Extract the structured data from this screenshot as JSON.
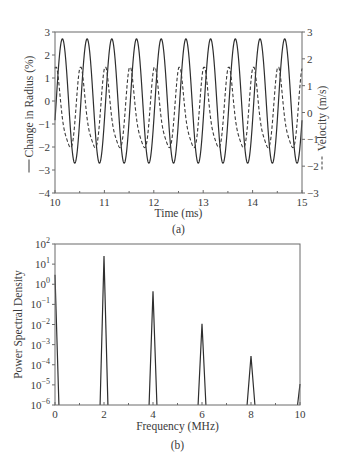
{
  "chart_data": [
    {
      "panel": "(a)",
      "type": "line",
      "xlabel": "Time (ms)",
      "ylabel_left": "Change in Radius (%)",
      "ylabel_right": "Velocity (m/s)",
      "xlim": [
        10,
        15
      ],
      "ylim_left": [
        -4,
        3
      ],
      "ylim_right": [
        -3,
        3
      ],
      "x_ticks": [
        10,
        11,
        12,
        13,
        14,
        15
      ],
      "y_ticks_left": [
        3,
        2,
        1,
        0,
        -1,
        -2,
        -3,
        -4
      ],
      "y_ticks_right": [
        3,
        2,
        1,
        0,
        -1,
        -2,
        -3
      ],
      "grid": false,
      "series": [
        {
          "name": "Change in Radius (%)",
          "axis": "left",
          "style": "solid",
          "model": "sinusoid",
          "amplitude": 2.7,
          "offset": 0.0,
          "period_ms": 0.5,
          "first_peak_ms": 10.15
        },
        {
          "name": "Velocity (m/s)",
          "axis": "right",
          "style": "dashed",
          "model": "skewed sinusoid",
          "max": 1.6,
          "min": -1.65,
          "period_ms": 0.5,
          "first_peak_ms": 10.03
        }
      ]
    },
    {
      "panel": "(b)",
      "type": "line",
      "xlabel": "Frequency (MHz)",
      "ylabel": "Power Spectral Density",
      "xlim": [
        0,
        10
      ],
      "ylim": [
        1e-06,
        100
      ],
      "yscale": "log",
      "x_ticks": [
        0,
        2,
        4,
        6,
        8,
        10
      ],
      "y_ticks": [
        "10^2",
        "10^1",
        "10^0",
        "10^-1",
        "10^-2",
        "10^-3",
        "10^-4",
        "10^-5",
        "10^-6"
      ],
      "grid": false,
      "peaks": [
        {
          "x": 0,
          "y": 3.0
        },
        {
          "x": 2,
          "y": 25
        },
        {
          "x": 4,
          "y": 0.45
        },
        {
          "x": 6,
          "y": 0.011
        },
        {
          "x": 8,
          "y": 0.00027
        },
        {
          "x": 10,
          "y": 1.1e-05
        }
      ]
    }
  ],
  "labels": {
    "a_caption": "(a)",
    "b_caption": "(b)",
    "a_xlabel": "Time (ms)",
    "a_ylabel_left": "Change in Radius (%)",
    "a_ylabel_right": "Velocity (m/s)",
    "b_xlabel": "Frequency (MHz)",
    "b_ylabel": "Power Spectral Density"
  }
}
